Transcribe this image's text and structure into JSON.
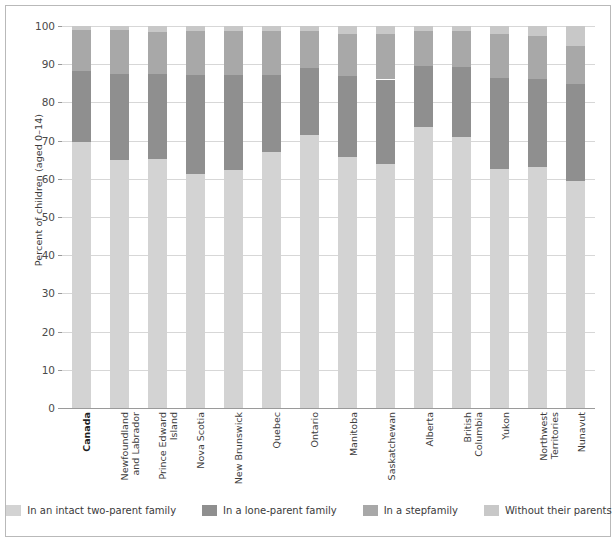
{
  "chart_data": {
    "type": "bar",
    "subtype": "stacked-100",
    "title": "",
    "xlabel": "",
    "ylabel": "Percent of children (aged 0–14)",
    "ylim": [
      0,
      100
    ],
    "yticks": [
      0,
      10,
      20,
      30,
      40,
      50,
      60,
      70,
      80,
      90,
      100
    ],
    "grid": true,
    "legend_position": "bottom",
    "categories": [
      "Canada",
      "Newfoundland and Labrador",
      "Prince Edward Island",
      "Nova Scotia",
      "New Brunswick",
      "Quebec",
      "Ontario",
      "Manitoba",
      "Saskatchewan",
      "Alberta",
      "British Columbia",
      "Yukon",
      "Northwest Territories",
      "Nunavut"
    ],
    "category_emphasis": [
      true,
      false,
      false,
      false,
      false,
      false,
      false,
      false,
      false,
      false,
      false,
      false,
      false,
      false
    ],
    "series": [
      {
        "name": "In an intact two-parent family",
        "color": "#d3d3d3",
        "values": [
          69.6,
          64.8,
          65.3,
          61.2,
          62.3,
          66.9,
          71.5,
          65.8,
          64.0,
          73.5,
          71.0,
          62.5,
          63.0,
          59.4
        ]
      },
      {
        "name": "In a lone-parent family",
        "color": "#8f8f8f",
        "values": [
          18.6,
          22.7,
          22.2,
          26.0,
          25.0,
          20.4,
          17.5,
          21.0,
          22.0,
          16.0,
          18.2,
          24.0,
          23.0,
          25.3
        ]
      },
      {
        "name": "In a stepfamily",
        "color": "#a8a8a8",
        "values": [
          10.7,
          11.4,
          11.0,
          11.4,
          11.4,
          11.5,
          9.8,
          11.1,
          11.9,
          9.3,
          9.5,
          11.4,
          11.3,
          10.0
        ]
      },
      {
        "name": "Without their parents",
        "color": "#c8c8c8",
        "values": [
          1.1,
          1.1,
          1.5,
          1.4,
          1.3,
          1.2,
          1.2,
          2.1,
          2.1,
          1.2,
          1.3,
          2.1,
          2.7,
          5.3
        ]
      }
    ]
  },
  "legend": {
    "items": [
      {
        "label": "In an intact two-parent family",
        "color": "#d3d3d3"
      },
      {
        "label": "In a lone-parent family",
        "color": "#8f8f8f"
      },
      {
        "label": "In a stepfamily",
        "color": "#a8a8a8"
      },
      {
        "label": "Without their parents",
        "color": "#c8c8c8"
      }
    ]
  },
  "colors": {
    "background": "#ffffff",
    "frame": "#b9b9b9",
    "gridline": "#d7d7d7",
    "axis": "#9a9a9a",
    "text": "#3a3a3a"
  }
}
